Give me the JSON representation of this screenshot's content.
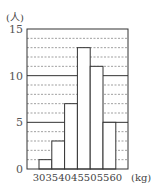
{
  "chart_data": {
    "type": "bar",
    "subtype": "histogram",
    "title": "",
    "xlabel": "(kg)",
    "ylabel": "(人)",
    "bin_edges": [
      30,
      35,
      40,
      45,
      50,
      55,
      60
    ],
    "categories": [
      "30-35",
      "35-40",
      "40-45",
      "45-50",
      "50-55",
      "55-60"
    ],
    "values": [
      1,
      3,
      7,
      13,
      11,
      5
    ],
    "x_tick_labels": [
      "30",
      "35",
      "40",
      "45",
      "50",
      "55",
      "60"
    ],
    "y_tick_labels": [
      "0",
      "5",
      "10",
      "15"
    ],
    "ylim": [
      0,
      15
    ],
    "grid": {
      "minor_step": 1,
      "minor_style": "dashed",
      "major_step": 5,
      "major_style": "solid"
    },
    "legend": null
  }
}
